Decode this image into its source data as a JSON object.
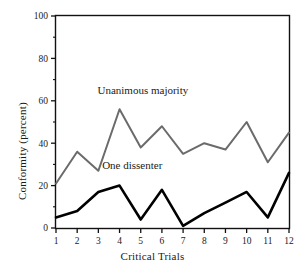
{
  "chart_data": {
    "type": "line",
    "title": "",
    "xlabel": "Critical Trials",
    "ylabel": "Conformity (percent)",
    "categories": [
      "1",
      "2",
      "3",
      "4",
      "5",
      "6",
      "7",
      "8",
      "9",
      "10",
      "11",
      "12"
    ],
    "x": [
      1,
      2,
      3,
      4,
      5,
      6,
      7,
      8,
      9,
      10,
      11,
      12
    ],
    "xlim": [
      1,
      12
    ],
    "ylim": [
      0,
      100
    ],
    "yticks": [
      0,
      20,
      40,
      60,
      80,
      100
    ],
    "ytick_labels": [
      "0",
      "20",
      "40",
      "60",
      "80",
      "100"
    ],
    "xticks": [
      1,
      2,
      3,
      4,
      5,
      6,
      7,
      8,
      9,
      10,
      11,
      12
    ],
    "xtick_labels": [
      "1",
      "2",
      "3",
      "4",
      "5",
      "6",
      "7",
      "8",
      "9",
      "10",
      "11",
      "12"
    ],
    "grid": false,
    "legend_position": "inline-annotation",
    "series": [
      {
        "name": "Unanimous majority",
        "color": "#6b6b6b",
        "line_width": 2,
        "values": [
          21,
          36,
          27,
          56,
          38,
          48,
          35,
          40,
          37,
          50,
          31,
          45
        ]
      },
      {
        "name": "One dissenter",
        "color": "#000000",
        "line_width": 2.6,
        "values": [
          5,
          8,
          17,
          20,
          4,
          18,
          1,
          7,
          12,
          17,
          5,
          26
        ]
      }
    ],
    "annotations": [
      {
        "text": "Unanimous majority",
        "x": 5.1,
        "y": 63,
        "name": "unanimous-majority-label"
      },
      {
        "text": "One dissenter",
        "x": 4.6,
        "y": 28,
        "name": "one-dissenter-label"
      }
    ]
  }
}
